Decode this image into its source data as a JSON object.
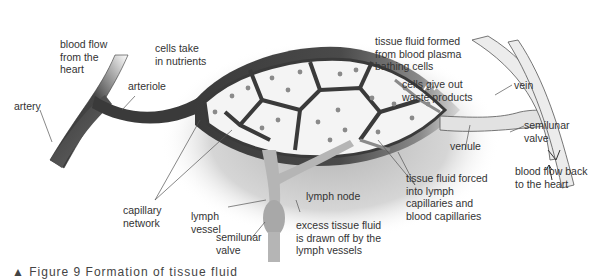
{
  "diagram": {
    "labels": {
      "blood_flow_from_heart": "blood flow\nfrom the\nheart",
      "cells_take_nutrients": "cells take\nin nutrients",
      "artery": "artery",
      "arteriole": "arteriole",
      "tissue_fluid_formed": "tissue fluid formed\nfrom blood plasma\nbathing cells",
      "cells_give_out_waste": "cells give out\nwaste products",
      "vein": "vein",
      "semilunar_valve_right": "semilunar\nvalve",
      "venule": "venule",
      "blood_flow_back": "blood flow back\nto the heart",
      "tissue_fluid_forced": "tissue fluid forced\ninto lymph\ncapillaries and\nblood capillaries",
      "capillary_network": "capillary\nnetwork",
      "lymph_vessel": "lymph\nvessel",
      "lymph_node": "lymph node",
      "semilunar_valve_bottom": "semilunar\nvalve",
      "excess_tissue_fluid": "excess tissue fluid\nis drawn off by the\nlymph vessels"
    },
    "caption": "▲ Figure 9  Formation of tissue fluid",
    "colors": {
      "arterial": "#3a3a3a",
      "venous": "#e2e2e2",
      "lymph": "#b5b5b5",
      "cell_fill": "#f4f4f4",
      "nucleus": "#8a8a8a",
      "text": "#333333"
    }
  }
}
